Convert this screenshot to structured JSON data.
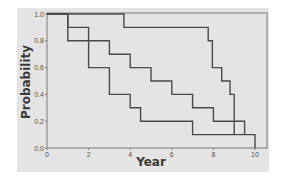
{
  "chart_data": {
    "type": "line",
    "subtype": "step (Kaplan-Meier survival curves)",
    "title": "",
    "xlabel": "Year",
    "ylabel": "Probability",
    "xlim": [
      0,
      10
    ],
    "ylim": [
      0.0,
      1.0
    ],
    "x_ticks": [
      "0",
      "2",
      "4",
      "6",
      "8",
      "10"
    ],
    "y_ticks": [
      "0.0",
      "0.2",
      "0.4",
      "0.6",
      "0.8",
      "1.0"
    ],
    "grid": false,
    "legend": null,
    "series": [
      {
        "name": "curve-1",
        "color": "#4a4a4a",
        "steps": [
          [
            0,
            1.0
          ],
          [
            3.7,
            0.9
          ],
          [
            7.75,
            0.8
          ],
          [
            7.95,
            0.6
          ],
          [
            8.4,
            0.5
          ],
          [
            8.8,
            0.4
          ],
          [
            9.0,
            0.1
          ]
        ],
        "end_x": 9.0
      },
      {
        "name": "curve-2",
        "color": "#4a4a4a",
        "steps": [
          [
            0,
            1.0
          ],
          [
            1,
            0.8
          ],
          [
            3,
            0.7
          ],
          [
            4,
            0.6
          ],
          [
            5,
            0.5
          ],
          [
            6,
            0.4
          ],
          [
            7,
            0.3
          ],
          [
            8,
            0.2
          ],
          [
            9.5,
            0.1
          ]
        ],
        "end_x": 9.5
      },
      {
        "name": "curve-3",
        "color": "#4a4a4a",
        "steps": [
          [
            0,
            1.0
          ],
          [
            1,
            0.9
          ],
          [
            2,
            0.6
          ],
          [
            3,
            0.4
          ],
          [
            4,
            0.3
          ],
          [
            4.5,
            0.2
          ],
          [
            7,
            0.1
          ],
          [
            10,
            0.0
          ]
        ],
        "end_x": 10
      }
    ]
  },
  "colors": {
    "panel_bg": "#e4e4e4",
    "frame": "#7a7a7a",
    "line": "#4a4a4a"
  }
}
